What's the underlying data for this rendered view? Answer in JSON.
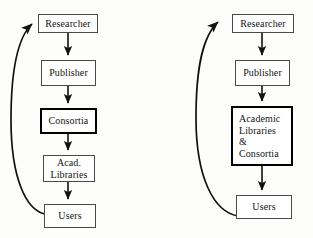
{
  "figure": {
    "background_color": "#fdfdfb",
    "line_color": "#111111",
    "box_border_color": "#4a4a4a",
    "emphasis_border_color": "#000000",
    "panel_count": 2
  },
  "panels": [
    {
      "id": "left",
      "name": "traditional-chain-with-separate-consortia",
      "nodes": [
        {
          "id": "researcher",
          "label": "Researcher",
          "emphasis": false,
          "align": "center"
        },
        {
          "id": "publisher",
          "label": "Publisher",
          "emphasis": false,
          "align": "center"
        },
        {
          "id": "consortia",
          "label": "Consortia",
          "emphasis": true,
          "align": "center"
        },
        {
          "id": "libraries",
          "label": "Acad.\nLibraries",
          "emphasis": false,
          "align": "center"
        },
        {
          "id": "users",
          "label": "Users",
          "emphasis": false,
          "align": "center"
        }
      ],
      "edges": [
        {
          "from": "researcher",
          "to": "publisher",
          "kind": "straight-down"
        },
        {
          "from": "publisher",
          "to": "consortia",
          "kind": "straight-down"
        },
        {
          "from": "consortia",
          "to": "libraries",
          "kind": "straight-down"
        },
        {
          "from": "libraries",
          "to": "users",
          "kind": "straight-down"
        },
        {
          "from": "users",
          "to": "researcher",
          "kind": "curved-feedback-left"
        }
      ]
    },
    {
      "id": "right",
      "name": "merged-chain-with-combined-libraries-and-consortia",
      "nodes": [
        {
          "id": "researcher",
          "label": "Researcher",
          "emphasis": false,
          "align": "center"
        },
        {
          "id": "publisher",
          "label": "Publisher",
          "emphasis": false,
          "align": "center"
        },
        {
          "id": "libraries",
          "label": "Academic\nLibraries\n&\nConsortia",
          "emphasis": true,
          "align": "left"
        },
        {
          "id": "users",
          "label": "Users",
          "emphasis": false,
          "align": "center"
        }
      ],
      "edges": [
        {
          "from": "researcher",
          "to": "publisher",
          "kind": "straight-down"
        },
        {
          "from": "publisher",
          "to": "libraries",
          "kind": "straight-down"
        },
        {
          "from": "libraries",
          "to": "users",
          "kind": "straight-down"
        },
        {
          "from": "users",
          "to": "researcher",
          "kind": "curved-feedback-left"
        }
      ]
    }
  ]
}
